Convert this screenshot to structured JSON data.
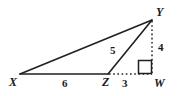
{
  "figure": {
    "type": "geometry-diagram",
    "shape_description": "triangle XYZ with altitude YW extended to right angle at W",
    "background_color": "#ffffff",
    "stroke_color": "#231f20",
    "text_color": "#1a1a1a",
    "vertices": [
      {
        "name": "vertex-x",
        "label": "X",
        "x": 20,
        "y": 74,
        "label_x": 9,
        "label_y": 76
      },
      {
        "name": "vertex-y",
        "label": "Y",
        "x": 152,
        "y": 20,
        "label_x": 156,
        "label_y": 6
      },
      {
        "name": "vertex-z",
        "label": "Z",
        "x": 108,
        "y": 74,
        "label_x": 102,
        "label_y": 76
      },
      {
        "name": "vertex-w",
        "label": "W",
        "x": 152,
        "y": 74,
        "label_x": 154,
        "label_y": 77
      }
    ],
    "segments": [
      {
        "name": "segment-xy",
        "from": "X",
        "to": "Y",
        "style": "solid"
      },
      {
        "name": "segment-xz",
        "from": "X",
        "to": "Z",
        "style": "solid"
      },
      {
        "name": "segment-zy",
        "from": "Z",
        "to": "Y",
        "style": "solid"
      },
      {
        "name": "segment-zw",
        "from": "Z",
        "to": "W",
        "style": "dotted"
      },
      {
        "name": "segment-yw",
        "from": "Y",
        "to": "W",
        "style": "dotted"
      }
    ],
    "measures": [
      {
        "name": "measure-xz",
        "value": "6",
        "for_segment": "segment-xz",
        "x": 62,
        "y": 78
      },
      {
        "name": "measure-zy",
        "value": "5",
        "for_segment": "segment-zy",
        "x": 110,
        "y": 45
      },
      {
        "name": "measure-zw",
        "value": "3",
        "for_segment": "segment-zw",
        "x": 122,
        "y": 78
      },
      {
        "name": "measure-yw",
        "value": "4",
        "for_segment": "segment-yw",
        "x": 158,
        "y": 42
      }
    ],
    "right_angle": {
      "name": "right-angle-marker-w",
      "at_vertex": "W",
      "x": 138,
      "y": 60,
      "size": 13
    }
  }
}
